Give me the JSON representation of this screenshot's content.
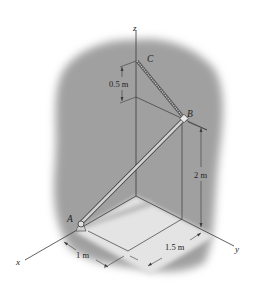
{
  "figure": {
    "type": "3D statics diagram",
    "axes": {
      "x": "x",
      "y": "y",
      "z": "z"
    },
    "points": {
      "A": "A",
      "B": "B",
      "C": "C"
    },
    "dimensions": {
      "cb_offset": "0.5 m",
      "height_b": "2 m",
      "x_distance": "1 m",
      "y_distance": "1.5 m"
    },
    "colors": {
      "background_shade": "#9e9e9e",
      "floor": "#e6e6e6",
      "line": "#3a3a3a",
      "rod": "#d9d9d9",
      "text": "#222222"
    }
  }
}
